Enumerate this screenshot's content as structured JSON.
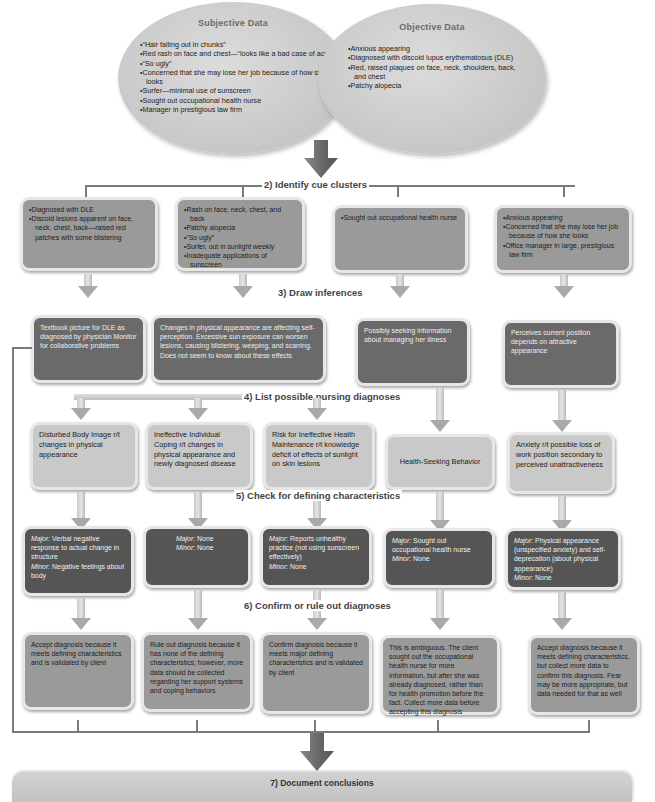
{
  "data_collection": {
    "subjective": {
      "title": "Subjective Data",
      "items": [
        "“Hair falling out in chunks”",
        "Red rash on face and chest—“looks like a bad case of acne”",
        "“So ugly”",
        "Concerned that she may lose her job because of how she looks",
        "Surfer—minimal use of sunscreen",
        "Sought out occupational health nurse",
        "Manager in prestigious law firm"
      ]
    },
    "objective": {
      "title": "Objective Data",
      "items": [
        "Anxious appearing",
        "Diagnosed with discoid lupus erythematosus (DLE)",
        "Red, raised plaques on face, neck, shoulders, back, and chest",
        "Patchy alopecia"
      ]
    }
  },
  "steps": {
    "s2": "2) Identify cue clusters",
    "s3": "3) Draw inferences",
    "s4": "4) List possible nursing diagnoses",
    "s5": "5) Check for defining characteristics",
    "s6": "6) Confirm or rule out diagnoses",
    "s7": "7) Document conclusions"
  },
  "cue_clusters": [
    {
      "items": [
        "Diagnosed with DLE",
        "Discoid lesions apparent on face, neck, chest, back—raised red patches with some blistering"
      ]
    },
    {
      "items": [
        "Rash on face, neck, chest, and back",
        "Patchy alopecia",
        "“So ugly”",
        "Surfer, out in sunlight weekly",
        "Inadequate applications of sunscreen"
      ]
    },
    {
      "items": [
        "Sought out occupational health nurse"
      ]
    },
    {
      "items": [
        "Anxious appearing",
        "Concerned that she may lose her job because of how she looks",
        "Office manager in large, prestigious law firm"
      ]
    }
  ],
  "inferences": [
    "Textbook picture for DLE as diagnosed by physician Monitor for collaborative problems",
    "Changes in physical appearance are affecting self-perception. Excessive sun exposure can worsen lesions, causing blistering, weeping, and scarring. Does not seem to know about these effects",
    "Possibly seeking information about managing her illness",
    "Perceives current position depends on attractive appearance"
  ],
  "diagnoses": [
    "Disturbed Body Image r/t changes in physical appearance",
    "Ineffective Individual Coping r/t changes in physical appearance and newly diagnosed disease",
    "Risk for Ineffective Health Maintenance r/t knowledge deficit of effects of sunlight on skin lesions",
    "Health-Seeking Behavior",
    "Anxiety r/t possible loss of work position secondary to perceived unattractiveness"
  ],
  "defining_characteristics": [
    {
      "major_label": "Major:",
      "major": "Verbal negative response to actual change in structure",
      "minor_label": "Minor:",
      "minor": "Negative feelings about body"
    },
    {
      "major_label": "Major:",
      "major": "None",
      "minor_label": "Minor:",
      "minor": "None"
    },
    {
      "major_label": "Major:",
      "major": "Reports unhealthy practice (not using sunscreen effectively)",
      "minor_label": "Minor:",
      "minor": "None"
    },
    {
      "major_label": "Major:",
      "major": "Sought out occupational health nurse",
      "minor_label": "Minor:",
      "minor": "None"
    },
    {
      "major_label": "Major:",
      "major": "Physical appearance (unspecified anxiety) and self-deprecation (about physical appearance)",
      "minor_label": "Minor:",
      "minor": "None"
    }
  ],
  "conclusions": [
    "Accept diagnosis because it meets defining characteristics and is validated by client",
    "Rule out diagnosis because it has none of the defining characteristics; however, more data should be collected regarding her support systems and coping behaviors",
    "Confirm diagnosis because it meets major defining characteristics and is validated by client",
    "This is ambiguous. The client sought out the occupational health nurse for more information, but after she was already diagnosed, rather than for health promotion before the fact. Collect more data before accepting this diagnosis",
    "Accept diagnosis because it meets defining characteristics, but collect more data to confirm this diagnosis. Fear may be more appropriate, but data needed for that as well"
  ],
  "colors": {
    "cue_box": "#9a9a9a",
    "inference_box": "#6a6a6a",
    "diagnosis_box": "#c9c9c9",
    "characteristics_box": "#555555",
    "conclusion_box": "#9a9a9a",
    "connector": "#7a7a7a"
  }
}
